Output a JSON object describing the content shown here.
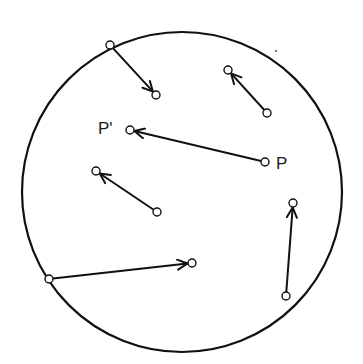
{
  "diagram": {
    "canvas": {
      "width": 363,
      "height": 364,
      "background": "#ffffff"
    },
    "stroke_color": "#111111",
    "boundary_circle": {
      "cx": 182,
      "cy": 192,
      "r": 160,
      "stroke_width": 2.2
    },
    "point_radius": 4,
    "arrows": [
      {
        "id": "arrow-1",
        "from": [
          110,
          45
        ],
        "to": [
          156,
          95
        ],
        "note": "starts on boundary"
      },
      {
        "id": "arrow-2",
        "from": [
          267,
          113
        ],
        "to": [
          228,
          70
        ]
      },
      {
        "id": "arrow-p",
        "from": [
          265,
          162
        ],
        "to": [
          130,
          130
        ],
        "from_label": "P",
        "to_label": "P'"
      },
      {
        "id": "arrow-4",
        "from": [
          157,
          212
        ],
        "to": [
          96,
          171
        ]
      },
      {
        "id": "arrow-5",
        "from": [
          49,
          279
        ],
        "to": [
          192,
          263
        ],
        "note": "starts on boundary"
      },
      {
        "id": "arrow-6",
        "from": [
          286,
          296
        ],
        "to": [
          293,
          203
        ]
      }
    ],
    "labels": [
      {
        "text": "P'",
        "x": 98,
        "y": 134
      },
      {
        "text": "P",
        "x": 276,
        "y": 169
      }
    ],
    "stray_dot": {
      "cx": 276,
      "cy": 51,
      "r": 0.9
    }
  }
}
